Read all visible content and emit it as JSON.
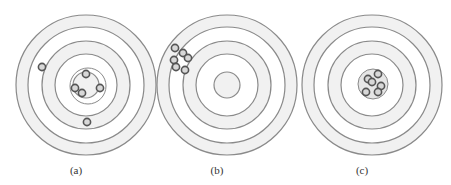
{
  "figure": {
    "panels": [
      {
        "caption": "(a)",
        "center": [
          86,
          85
        ],
        "description": "scattered hits, low precision, centered on average",
        "shots": [
          [
            42,
            67
          ],
          [
            86,
            74
          ],
          [
            75,
            88
          ],
          [
            82,
            93
          ],
          [
            100,
            88
          ],
          [
            87,
            122
          ]
        ]
      },
      {
        "caption": "(b)",
        "center": [
          227,
          85
        ],
        "description": "tight cluster off-center at upper left, high precision, low accuracy",
        "shots": [
          [
            175,
            48
          ],
          [
            183,
            53
          ],
          [
            174,
            60
          ],
          [
            188,
            58
          ],
          [
            185,
            70
          ],
          [
            176,
            67
          ]
        ]
      },
      {
        "caption": "(c)",
        "center": [
          372,
          85
        ],
        "description": "tight cluster at bullseye, high precision, high accuracy",
        "shots": [
          [
            368,
            79
          ],
          [
            378,
            74
          ],
          [
            372,
            82
          ],
          [
            381,
            86
          ],
          [
            366,
            92
          ],
          [
            378,
            92
          ]
        ]
      }
    ],
    "rings": [
      {
        "r": 70,
        "fill": "#f1f1f1",
        "stroke": "#8a8a8a"
      },
      {
        "r": 58,
        "fill": "#ffffff",
        "stroke": "#8a8a8a"
      },
      {
        "r": 44,
        "fill": "#f1f1f1",
        "stroke": "#8a8a8a"
      },
      {
        "r": 31,
        "fill": "#ffffff",
        "stroke": "#8a8a8a"
      },
      {
        "r": 13,
        "fill": "#f1f1f1",
        "stroke": "#8a8a8a"
      }
    ],
    "inner_cluster_ring": {
      "panel_a_r": 18,
      "panel_c_r": 15
    },
    "colors": {
      "ring_stroke": "#8a8a8a",
      "band_fill": "#f1f1f1",
      "shot_stroke": "#555555",
      "shot_fill": "#d8d8d8"
    }
  }
}
